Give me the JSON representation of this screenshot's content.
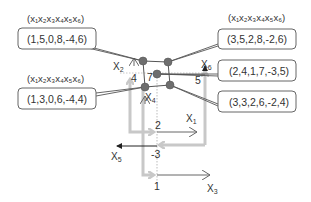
{
  "vector_header": "(x1x2x3x4x5x6)",
  "boxes": {
    "top_left": {
      "header": "(x₁x₂x₃x₄x₅x₆)",
      "value": "(1,5,0,8,-4,6)"
    },
    "mid_left": {
      "header": "(x₁x₂x₃x₄x₅x₆)",
      "value": "(1,3,0,6,-4,4)"
    },
    "top_right": {
      "header": "(x₁x₂x₃x₄x₅x₆)",
      "value": "(3,5,2,8,-2,6)"
    },
    "mid_right": {
      "value": "(2,4,1,7,-3,5)"
    },
    "low_right": {
      "value": "(3,3,2,6,-2,4)"
    }
  },
  "axes": {
    "x1": {
      "base": "X",
      "sub": "1",
      "value": "2"
    },
    "x2": {
      "base": "X",
      "sub": "2",
      "value": "4"
    },
    "x3": {
      "base": "X",
      "sub": "3",
      "value": "1"
    },
    "x4": {
      "base": "X",
      "sub": "4",
      "value": "7"
    },
    "x5": {
      "base": "X",
      "sub": "5",
      "value": "-3"
    },
    "x6": {
      "base": "X",
      "sub": "6",
      "value": "5"
    }
  },
  "colors": {
    "gray_arrow": "#c8c8c8",
    "node": "#6e6e6e",
    "line": "#555555",
    "box_border": "#666666"
  }
}
